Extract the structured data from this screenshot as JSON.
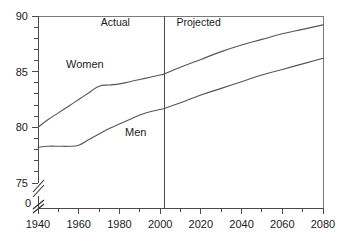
{
  "chart_data": {
    "type": "line",
    "title": "",
    "xlabel": "",
    "ylabel": "",
    "xlim": [
      1940,
      2080
    ],
    "ylim": [
      75,
      90
    ],
    "y_axis_break": true,
    "y_break_label": "0",
    "grid": false,
    "legend_position": "inline-annotation",
    "x_ticks_major": [
      1940,
      1960,
      1980,
      2000,
      2020,
      2040,
      2060,
      2080
    ],
    "x_tick_labels": [
      "1940",
      "1960",
      "1980",
      "2000",
      "2020",
      "2040",
      "2060",
      "2080"
    ],
    "x_ticks_minor_step": 10,
    "y_ticks_major": [
      75,
      80,
      85,
      90
    ],
    "y_tick_labels": [
      "75",
      "80",
      "85",
      "90"
    ],
    "y_ticks_minor_step": 1,
    "annotations": [
      {
        "name": "actual",
        "text": "Actual",
        "x": 1978,
        "y": 89.1
      },
      {
        "name": "projected",
        "text": "Projected",
        "x": 2008,
        "y": 89.1
      }
    ],
    "divider": {
      "x": 2002,
      "label_left": "Actual",
      "label_right": "Projected"
    },
    "series": [
      {
        "name": "Women",
        "label": "Women",
        "label_x": 1963,
        "label_y": 85.3,
        "color": "#555555",
        "x": [
          1940,
          1945,
          1950,
          1955,
          1960,
          1965,
          1970,
          1975,
          1980,
          1985,
          1990,
          1995,
          2000,
          2002,
          2010,
          2020,
          2030,
          2040,
          2050,
          2060,
          2070,
          2080
        ],
        "values": [
          80.0,
          80.7,
          81.3,
          81.9,
          82.5,
          83.1,
          83.7,
          83.8,
          83.9,
          84.1,
          84.3,
          84.5,
          84.7,
          84.8,
          85.4,
          86.1,
          86.8,
          87.4,
          87.9,
          88.4,
          88.8,
          89.2
        ]
      },
      {
        "name": "Men",
        "label": "Men",
        "label_x": 1988,
        "label_y": 79.2,
        "color": "#555555",
        "x": [
          1940,
          1945,
          1950,
          1955,
          1960,
          1965,
          1970,
          1975,
          1980,
          1985,
          1990,
          1995,
          2000,
          2002,
          2010,
          2020,
          2030,
          2040,
          2050,
          2060,
          2070,
          2080
        ],
        "values": [
          78.2,
          78.3,
          78.3,
          78.3,
          78.4,
          78.9,
          79.4,
          79.9,
          80.3,
          80.7,
          81.1,
          81.4,
          81.6,
          81.7,
          82.2,
          82.9,
          83.5,
          84.1,
          84.7,
          85.2,
          85.7,
          86.2
        ]
      }
    ]
  }
}
